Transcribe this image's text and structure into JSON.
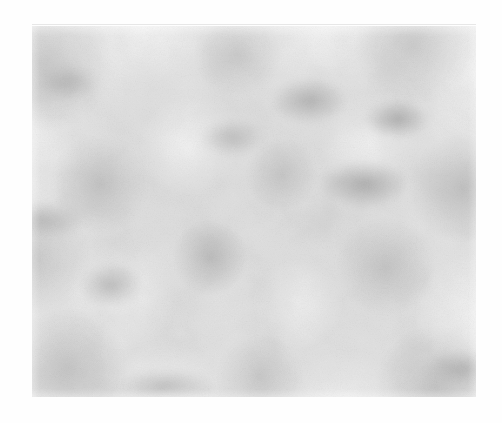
{
  "page": {
    "background_color": "#fefefe",
    "width": 502,
    "height": 423
  },
  "artifact": {
    "name": "scan-line",
    "color": "#969696"
  },
  "plate": {
    "label": "",
    "x": 32,
    "y": 26,
    "width": 444,
    "height": 371,
    "base_color": "#e2e2e2",
    "light_tone": "#f5f5f5",
    "mid_tone": "#d4d4d4",
    "dark_tone": "#a8a8a8",
    "texture": "mottled-grain",
    "grain_opacity": 0.55
  }
}
